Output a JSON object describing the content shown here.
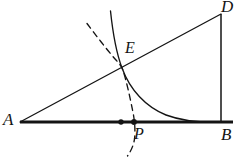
{
  "figure": {
    "type": "geometry-diagram",
    "width": 238,
    "height": 158,
    "background_color": "#ffffff",
    "stroke_color": "#141414",
    "labels": {
      "A": "A",
      "B": "B",
      "D": "D",
      "E": "E",
      "P": "P"
    },
    "points": {
      "A": {
        "x": 20,
        "y": 122
      },
      "B": {
        "x": 221,
        "y": 122
      },
      "D": {
        "x": 221,
        "y": 14
      },
      "E": {
        "x": 122,
        "y": 68
      },
      "P": {
        "x": 134,
        "y": 122
      },
      "dot_left": {
        "x": 121,
        "y": 122
      }
    },
    "segments": [
      {
        "name": "baseline-AB",
        "from": "A",
        "to": "B",
        "style": "solid",
        "thick": true
      },
      {
        "name": "hypotenuse-AD",
        "from": "A",
        "to": "D",
        "style": "solid",
        "thick": false
      },
      {
        "name": "vertical-BD",
        "from": "B",
        "to": "D",
        "style": "solid",
        "thick": false
      }
    ],
    "curves": [
      {
        "name": "solid-decay-curve",
        "style": "solid",
        "through": [
          "E"
        ],
        "asymptote": "baseline-AB"
      },
      {
        "name": "dashed-curve",
        "style": "dashed",
        "through": [
          "E",
          "P"
        ]
      }
    ],
    "dots": [
      {
        "name": "dot-unlabeled",
        "x": 121,
        "y": 122
      },
      {
        "name": "dot-P",
        "x": 134,
        "y": 122
      }
    ]
  }
}
